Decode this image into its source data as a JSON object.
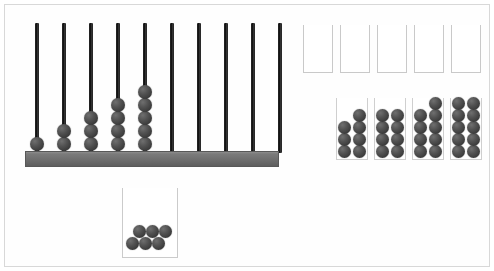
{
  "scene": {
    "title": "Abacus counting manipulative workspace",
    "width": 494,
    "height": 271,
    "background_color": "#ffffff",
    "frame_color": "#d8d8d8"
  },
  "colors": {
    "bead": "#4a4a4a",
    "bead_highlight": "#6f6f6f",
    "bead_shadow": "#2e2e2e",
    "rod": "#1d1d1d",
    "base_bar": "#6e6e6e",
    "base_bar_top": "#8d8d8d",
    "container_outline": "#c9c9c9"
  },
  "abacus": {
    "name": "ten-rod abacus",
    "rod_count": 10,
    "base": {
      "x": 6,
      "y": 132,
      "width": 254,
      "height": 16
    },
    "rod_top_y": 4,
    "rod_height": 130,
    "rod_width": 4,
    "rod_spacing": 27,
    "first_rod_x": 18,
    "bead_diameter": 14,
    "rods": [
      {
        "index": 1,
        "bead_count": 1
      },
      {
        "index": 2,
        "bead_count": 2
      },
      {
        "index": 3,
        "bead_count": 3
      },
      {
        "index": 4,
        "bead_count": 4
      },
      {
        "index": 5,
        "bead_count": 5
      },
      {
        "index": 6,
        "bead_count": 0
      },
      {
        "index": 7,
        "bead_count": 0
      },
      {
        "index": 8,
        "bead_count": 0
      },
      {
        "index": 9,
        "bead_count": 0
      },
      {
        "index": 10,
        "bead_count": 0
      }
    ],
    "total_beads_on_abacus": 15
  },
  "empty_boxes": {
    "name": "five empty open-top boxes",
    "count": 5,
    "top": 20,
    "width": 30,
    "height": 48,
    "contents": 0,
    "boxes": [
      {
        "index": 1,
        "x": 298,
        "fill": 0
      },
      {
        "index": 2,
        "x": 335,
        "fill": 0
      },
      {
        "index": 3,
        "x": 372,
        "fill": 0
      },
      {
        "index": 4,
        "x": 409,
        "fill": 0
      },
      {
        "index": 5,
        "x": 446,
        "fill": 0
      }
    ]
  },
  "bead_piles": {
    "name": "four filled bead columns",
    "count": 4,
    "box_width": 32,
    "box_height": 62,
    "box_top": 93,
    "columns_per_pile": 2,
    "piles": [
      {
        "index": 1,
        "x": 331,
        "bead_count": 7,
        "full_rows": 3,
        "top_partial": 1
      },
      {
        "index": 2,
        "x": 369,
        "bead_count": 8,
        "full_rows": 4,
        "top_partial": 0
      },
      {
        "index": 3,
        "x": 407,
        "bead_count": 9,
        "full_rows": 4,
        "top_partial": 1
      },
      {
        "index": 4,
        "x": 445,
        "bead_count": 10,
        "full_rows": 5,
        "top_partial": 0
      }
    ],
    "total_beads_in_piles": 34
  },
  "tray": {
    "name": "bottom loose bead tray",
    "x": 117,
    "y": 183,
    "width": 56,
    "height": 70,
    "bead_count": 6,
    "beads": [
      {
        "index": 1,
        "x": 3,
        "y": 49
      },
      {
        "index": 2,
        "x": 16,
        "y": 49
      },
      {
        "index": 3,
        "x": 29,
        "y": 49
      },
      {
        "index": 4,
        "x": 10,
        "y": 37
      },
      {
        "index": 5,
        "x": 23,
        "y": 37
      },
      {
        "index": 6,
        "x": 36,
        "y": 37
      }
    ]
  },
  "totals": {
    "beads_on_abacus": 15,
    "beads_in_piles": 34,
    "beads_in_tray": 6,
    "beads_total": 55
  }
}
